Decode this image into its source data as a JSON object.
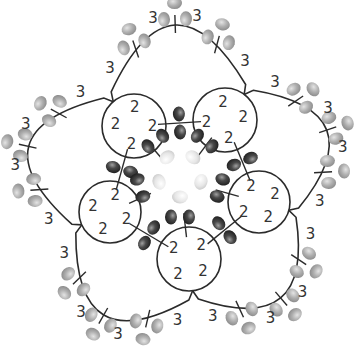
{
  "diagram": {
    "canvas": {
      "width": 360,
      "height": 354
    },
    "colors": {
      "line": "#2b2b2b",
      "dark_bead": "#3e3e3e",
      "dark_bead_hi": "#9a9a9a",
      "light_bead": "#a8a8a8",
      "light_bead_hi": "#e6e6e6",
      "center_bead": "#e8e8e8",
      "center_bead_edge": "#c8c8c8",
      "text": "#333333"
    },
    "center": [
      180,
      180
    ],
    "inner_rings": [
      {
        "id": "ring-top-left",
        "cx": 134,
        "cy": 126,
        "r": 32,
        "labels": [
          "2",
          "2",
          "2",
          "2"
        ]
      },
      {
        "id": "ring-top-right",
        "cx": 225,
        "cy": 120,
        "r": 32,
        "labels": [
          "2",
          "2",
          "2",
          "2"
        ]
      },
      {
        "id": "ring-right",
        "cx": 259,
        "cy": 202,
        "r": 31,
        "labels": [
          "2",
          "2",
          "2",
          "2"
        ]
      },
      {
        "id": "ring-bottom",
        "cx": 189,
        "cy": 259,
        "r": 32,
        "labels": [
          "2",
          "2",
          "2",
          "2"
        ]
      },
      {
        "id": "ring-left",
        "cx": 110,
        "cy": 212,
        "r": 31,
        "labels": [
          "2",
          "2",
          "2",
          "2"
        ]
      }
    ],
    "ring_label": "2",
    "chain_label": "3",
    "outer_chains": [
      {
        "id": "chain-top",
        "from": 0,
        "to": 1,
        "picots": 3,
        "labels": [
          "3",
          "3",
          "3",
          "3"
        ]
      },
      {
        "id": "chain-right",
        "from": 1,
        "to": 2,
        "picots": 3,
        "labels": [
          "3",
          "3",
          "3",
          "3"
        ]
      },
      {
        "id": "chain-bottom-right",
        "from": 2,
        "to": 3,
        "picots": 3,
        "labels": [
          "3",
          "3",
          "3",
          "3"
        ]
      },
      {
        "id": "chain-bottom-left",
        "from": 3,
        "to": 4,
        "picots": 3,
        "labels": [
          "3",
          "3",
          "3",
          "3"
        ]
      },
      {
        "id": "chain-left",
        "from": 4,
        "to": 0,
        "picots": 3,
        "labels": [
          "3",
          "3",
          "3",
          "3"
        ]
      }
    ],
    "dark_bead_pairs_between_rings": 5,
    "center_beads": 5,
    "legend": {
      "ring_count_label": "2",
      "chain_count_label": "3",
      "bead_types": [
        "dark bead",
        "light picot bead",
        "pale center bead"
      ]
    }
  }
}
